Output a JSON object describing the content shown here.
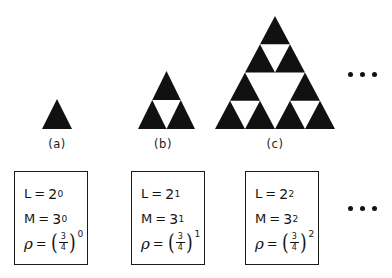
{
  "figure": {
    "background_color": "#ffffff",
    "ink_color": "#111111"
  },
  "stages": [
    {
      "id": "a",
      "caption": "(a)",
      "level": 0,
      "L_label": "L",
      "L_base": "2",
      "L_exponent": "0",
      "M_label": "M",
      "M_base": "3",
      "M_exponent": "0",
      "rho_label": "ρ",
      "rho_numerator": "3",
      "rho_denominator": "4",
      "rho_exponent": "0",
      "equals": "=",
      "paren_open": "(",
      "paren_close": ")"
    },
    {
      "id": "b",
      "caption": "(b)",
      "level": 1,
      "L_label": "L",
      "L_base": "2",
      "L_exponent": "1",
      "M_label": "M",
      "M_base": "3",
      "M_exponent": "1",
      "rho_label": "ρ",
      "rho_numerator": "3",
      "rho_denominator": "4",
      "rho_exponent": "1",
      "equals": "=",
      "paren_open": "(",
      "paren_close": ")"
    },
    {
      "id": "c",
      "caption": "(c)",
      "level": 2,
      "L_label": "L",
      "L_base": "2",
      "L_exponent": "2",
      "M_label": "M",
      "M_base": "3",
      "M_exponent": "2",
      "rho_label": "ρ",
      "rho_numerator": "3",
      "rho_denominator": "4",
      "rho_exponent": "2",
      "equals": "=",
      "paren_open": "(",
      "paren_close": ")"
    }
  ],
  "ellipsis": {
    "top": "• • •",
    "bottom": "• • •",
    "dot_count": 3
  }
}
